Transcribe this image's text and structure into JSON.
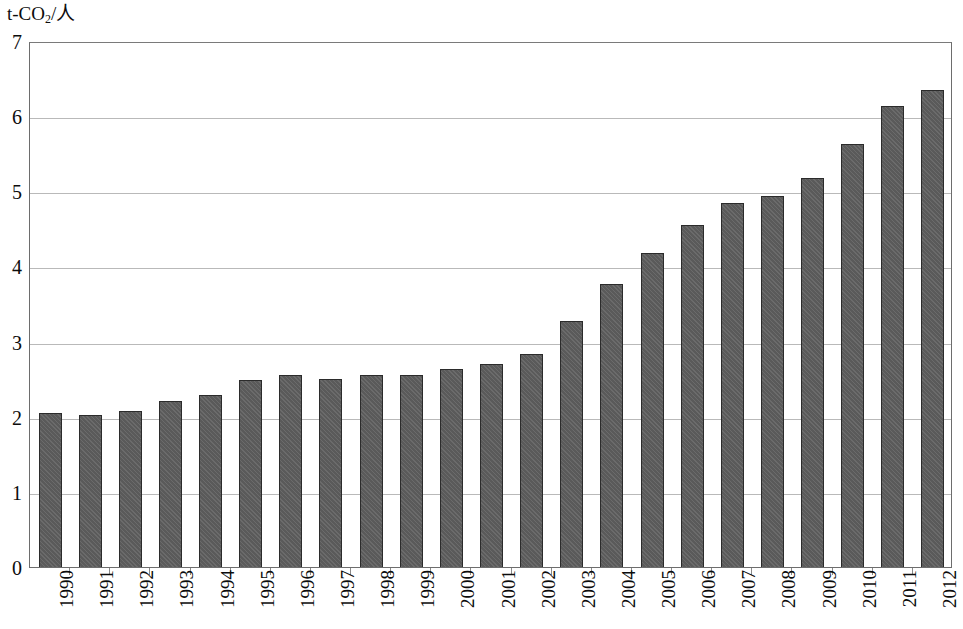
{
  "chart_data": {
    "type": "bar",
    "title": "",
    "subtitle": "",
    "xlabel": "",
    "ylabel": "t-CO2/人",
    "ylabel_parts": {
      "prefix": "t-CO",
      "sub": "2",
      "suffix": "/人"
    },
    "categories": [
      "1990",
      "1991",
      "1992",
      "1993",
      "1994",
      "1995",
      "1996",
      "1997",
      "1998",
      "1999",
      "2000",
      "2001",
      "2002",
      "2003",
      "2004",
      "2005",
      "2006",
      "2007",
      "2008",
      "2009",
      "2010",
      "2011",
      "2012"
    ],
    "values": [
      2.05,
      2.02,
      2.08,
      2.21,
      2.29,
      2.49,
      2.55,
      2.5,
      2.56,
      2.56,
      2.63,
      2.7,
      2.84,
      3.28,
      3.76,
      4.18,
      4.55,
      4.84,
      4.94,
      5.18,
      5.63,
      6.14,
      6.35
    ],
    "ylim": [
      0,
      7
    ],
    "ytick_labels": [
      "7",
      "6",
      "5",
      "4",
      "3",
      "2",
      "1",
      "0"
    ],
    "ytick_values": [
      7,
      6,
      5,
      4,
      3,
      2,
      1,
      0
    ],
    "grid": true,
    "grid_axis": "y",
    "legend": null,
    "legend_position": "none",
    "bar_color": "#5a5a5a",
    "bar_edge_color": "#2b2b2b",
    "grid_color": "#b9b9b9",
    "axis_color": "#6d6d6d",
    "background_color": "#ffffff",
    "series": [
      {
        "name": "CO2 emissions per capita",
        "values": [
          2.05,
          2.02,
          2.08,
          2.21,
          2.29,
          2.49,
          2.55,
          2.5,
          2.56,
          2.56,
          2.63,
          2.7,
          2.84,
          3.28,
          3.76,
          4.18,
          4.55,
          4.84,
          4.94,
          5.18,
          5.63,
          6.14,
          6.35
        ]
      }
    ]
  }
}
